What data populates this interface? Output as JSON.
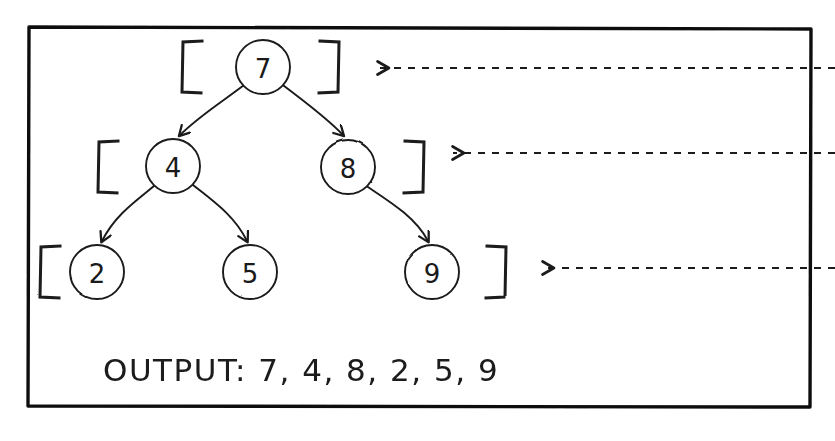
{
  "diagram": {
    "style": "hand-drawn whiteboard sketch, black ink on white",
    "frame": {
      "name": "outer-border-box",
      "x": 28,
      "y": 26,
      "width": 784,
      "height": 382,
      "stroke_color": "#111111",
      "stroke_width": 3
    },
    "colors": {
      "ink": "#1a1a1a",
      "background": "#ffffff",
      "frame": "#111111"
    },
    "levels": [
      {
        "index": 0,
        "label": "level-0",
        "bracket_left_x": 182,
        "bracket_right_x": 320,
        "bracket_y": 41,
        "bracket_height": 52,
        "arrow_tip_x": 375,
        "arrow_end_x": 835,
        "arrow_y": 68,
        "nodes": [
          "7"
        ]
      },
      {
        "index": 1,
        "label": "level-1",
        "bracket_left_x": 98,
        "bracket_right_x": 405,
        "bracket_y": 141,
        "bracket_height": 52,
        "arrow_tip_x": 450,
        "arrow_end_x": 835,
        "arrow_y": 153,
        "nodes": [
          "4",
          "8"
        ]
      },
      {
        "index": 2,
        "label": "level-2",
        "bracket_left_x": 40,
        "bracket_right_x": 487,
        "bracket_y": 246,
        "bracket_height": 52,
        "arrow_tip_x": 540,
        "arrow_end_x": 835,
        "arrow_y": 268,
        "nodes": [
          "2",
          "5",
          "9"
        ]
      }
    ],
    "nodes": [
      {
        "id": "n7",
        "value": "7",
        "cx": 263,
        "cy": 67,
        "r": 27,
        "level": 0
      },
      {
        "id": "n4",
        "value": "4",
        "cx": 173,
        "cy": 166,
        "r": 27,
        "level": 1
      },
      {
        "id": "n8",
        "value": "8",
        "cx": 348,
        "cy": 167,
        "r": 27,
        "level": 1
      },
      {
        "id": "n2",
        "value": "2",
        "cx": 97,
        "cy": 272,
        "r": 27,
        "level": 2
      },
      {
        "id": "n5",
        "value": "5",
        "cx": 250,
        "cy": 272,
        "r": 27,
        "level": 2
      },
      {
        "id": "n9",
        "value": "9",
        "cx": 432,
        "cy": 272,
        "r": 27,
        "level": 2
      }
    ],
    "edges": [
      {
        "id": "e7-4",
        "from": "7",
        "to": "4",
        "label": "edge-7-to-4"
      },
      {
        "id": "e7-8",
        "from": "7",
        "to": "8",
        "label": "edge-7-to-8"
      },
      {
        "id": "e4-2",
        "from": "4",
        "to": "2",
        "label": "edge-4-to-2"
      },
      {
        "id": "e4-5",
        "from": "4",
        "to": "5",
        "label": "edge-4-to-5"
      },
      {
        "id": "e8-9",
        "from": "8",
        "to": "9",
        "label": "edge-8-to-9"
      }
    ],
    "output": {
      "label": "OUTPUT:",
      "values": "7, 4, 8, 2, 5, 9",
      "full_text": "OUTPUT: 7, 4, 8, 2, 5, 9",
      "x": 103,
      "y": 380,
      "font_size": 30
    }
  }
}
